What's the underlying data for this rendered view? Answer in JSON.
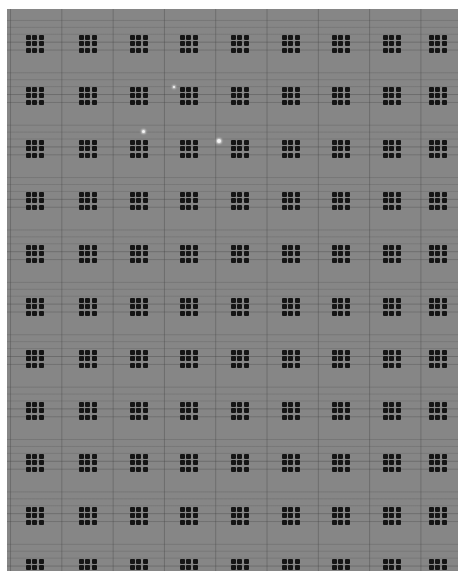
{
  "image": {
    "description": "Grayscale micrograph of a regular array of 3x3 dark dot clusters on a gray background with faint grid lines",
    "colors": {
      "background": "#868686",
      "dots": "#151515",
      "grid_lines": "#6a6a6a",
      "bright_spots": "#f4f4f4",
      "margin": "#ffffff"
    },
    "grid": {
      "columns": 9,
      "rows": 11,
      "column_centers_x": [
        34,
        87,
        138,
        188,
        239,
        290,
        340,
        391,
        437
      ],
      "row_centers_y": [
        43,
        95,
        148,
        200,
        253,
        306,
        358,
        410,
        462,
        515,
        567
      ],
      "dots_per_cluster": "3x3"
    },
    "bright_spots": [
      {
        "x": 174,
        "y": 87,
        "r": 1
      },
      {
        "x": 143,
        "y": 131,
        "r": 1.5
      },
      {
        "x": 219,
        "y": 141,
        "r": 2
      }
    ]
  }
}
